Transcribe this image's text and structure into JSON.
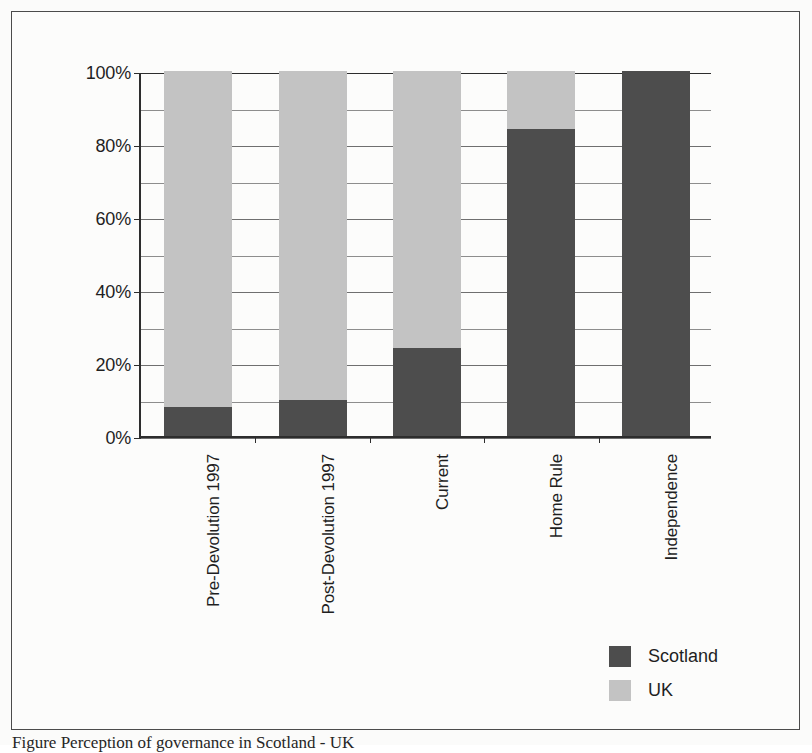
{
  "figure": {
    "caption": "Figure    Perception of governance in Scotland - UK"
  },
  "legend": {
    "position": "bottom-right",
    "items": [
      {
        "label": "Scotland",
        "color": "#4d4d4d",
        "swatch": "scotland"
      },
      {
        "label": "UK",
        "color": "#c3c3c3",
        "swatch": "uk"
      }
    ]
  },
  "axis": {
    "y_ticks": [
      "0%",
      "20%",
      "40%",
      "60%",
      "80%",
      "100%"
    ]
  },
  "chart_data": {
    "type": "bar",
    "subtype": "stacked-100-percent",
    "title": "",
    "xlabel": "",
    "ylabel": "",
    "ylim": [
      0,
      100
    ],
    "ytick_values": [
      0,
      20,
      40,
      60,
      80,
      100
    ],
    "ytick_labels": [
      "0%",
      "20%",
      "40%",
      "60%",
      "80%",
      "100%"
    ],
    "gridline_interval": 10,
    "grid": true,
    "legend_position": "bottom-right",
    "categories": [
      "Pre-Devolution 1997",
      "Post-Devolution 1997",
      "Current",
      "Home Rule",
      "Independence"
    ],
    "series": [
      {
        "name": "Scotland",
        "color": "#4d4d4d",
        "values": [
          8,
          10,
          24,
          84,
          100
        ]
      },
      {
        "name": "UK",
        "color": "#c3c3c3",
        "values": [
          92,
          90,
          76,
          16,
          0
        ]
      }
    ]
  }
}
